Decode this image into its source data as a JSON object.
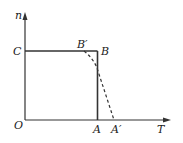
{
  "diagram": {
    "axes": {
      "y_label": "n",
      "x_label": "T",
      "origin_label": "O"
    },
    "points": {
      "C": "C",
      "B_prime": "B′",
      "B": "B",
      "A": "A",
      "A_prime": "A′"
    },
    "colors": {
      "line": "#333333",
      "background": "#ffffff"
    }
  }
}
